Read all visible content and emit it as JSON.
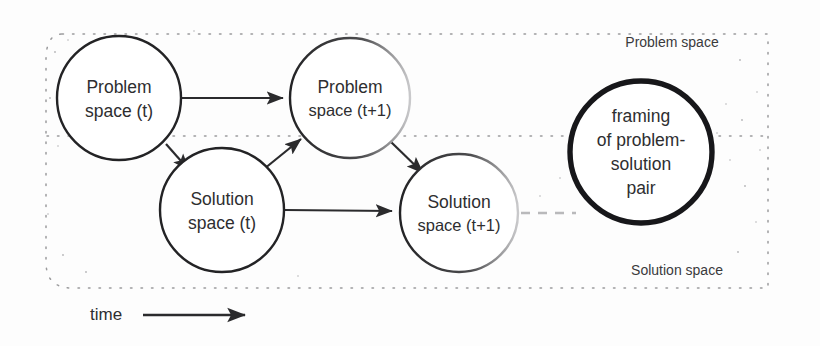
{
  "diagram": {
    "nodes": [
      {
        "id": "problem-t",
        "line1": "Problem",
        "line2": "space (t)",
        "cx": 119,
        "cy": 98,
        "r": 62,
        "weight": "thin"
      },
      {
        "id": "problem-t1",
        "line1": "Problem",
        "line2": "space (t+1)",
        "cx": 350,
        "cy": 98,
        "r": 60,
        "weight": "thin"
      },
      {
        "id": "solution-t",
        "line1": "Solution",
        "line2": "space (t)",
        "cx": 222,
        "cy": 210,
        "r": 62,
        "weight": "thin"
      },
      {
        "id": "solution-t1",
        "line1": "Solution",
        "line2": "space (t+1)",
        "cx": 459,
        "cy": 213,
        "r": 59,
        "weight": "thin"
      },
      {
        "id": "framing",
        "line1": "framing",
        "line2": "of problem-",
        "line3": "solution",
        "line4": "pair",
        "cx": 641,
        "cy": 152,
        "r": 71,
        "weight": "thick"
      }
    ],
    "region_labels": {
      "problem_space": "Problem space",
      "solution_space": "Solution space"
    },
    "axis": {
      "time_label": "time"
    },
    "colors": {
      "ink": "#232325",
      "thick_ink": "#17171a",
      "text": "#2e2e30",
      "dotted": "#9a9a9c",
      "paper": "#fdfdfd"
    }
  }
}
